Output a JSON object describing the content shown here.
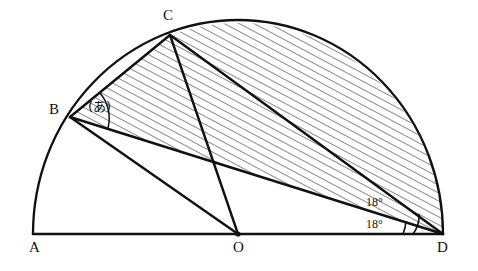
{
  "figure": {
    "type": "geometry-diagram",
    "background_color": "#ffffff",
    "stroke_color": "#111111",
    "hatch_color": "#333333"
  },
  "vertices": [
    {
      "name": "A",
      "label": "A",
      "x": 33,
      "y": 234,
      "label_x": 29,
      "label_y": 240
    },
    {
      "name": "O",
      "label": "O",
      "x": 238,
      "y": 234,
      "label_x": 233,
      "label_y": 240
    },
    {
      "name": "D",
      "label": "D",
      "x": 443,
      "y": 234,
      "label_x": 437,
      "label_y": 240
    },
    {
      "name": "B",
      "label": "B",
      "x": 70,
      "y": 117,
      "label_x": 49,
      "label_y": 102
    },
    {
      "name": "C",
      "label": "C",
      "x": 170,
      "y": 35,
      "label_x": 163,
      "label_y": 8
    }
  ],
  "angles": [
    {
      "name": "angle-at-B",
      "label": "(あ)",
      "vertex": "B",
      "label_x": 88,
      "label_y": 100
    },
    {
      "name": "angle-bdc",
      "label": "18°",
      "vertex": "D",
      "label_x": 366,
      "label_y": 196
    },
    {
      "name": "angle-bdo",
      "label": "18°",
      "vertex": "D",
      "label_x": 366,
      "label_y": 218
    }
  ],
  "segments": [
    {
      "name": "segment-AD",
      "from": "A",
      "to": "D"
    },
    {
      "name": "segment-BC",
      "from": "B",
      "to": "C"
    },
    {
      "name": "segment-BO",
      "from": "B",
      "to": "O"
    },
    {
      "name": "segment-BD",
      "from": "B",
      "to": "D"
    },
    {
      "name": "segment-CO",
      "from": "C",
      "to": "O"
    },
    {
      "name": "segment-CD",
      "from": "C",
      "to": "D"
    }
  ],
  "arc": {
    "name": "semicircle-arc",
    "center_x": 238,
    "center_y": 234,
    "radius_x": 205,
    "radius_y": 214
  },
  "shaded_region": {
    "name": "hatched-region-BCD",
    "boundary": [
      "B",
      "C",
      "arc C to D",
      "D"
    ],
    "hatch_angle_deg": 62,
    "hatch_spacing_px": 7
  }
}
